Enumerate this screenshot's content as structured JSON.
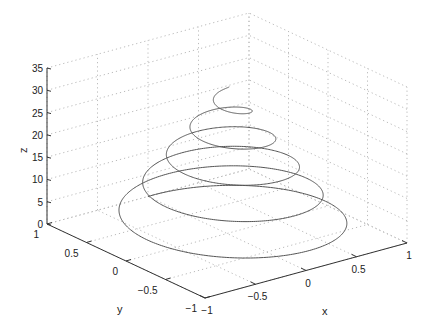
{
  "chart_data": {
    "type": "line3d",
    "title": "",
    "xlabel": "x",
    "ylabel": "y",
    "zlabel": "z",
    "xlim": [
      -1,
      1
    ],
    "ylim": [
      -1,
      1
    ],
    "zlim": [
      0,
      35
    ],
    "grid": true,
    "x_ticks": [
      -1,
      -0.5,
      0,
      0.5,
      1
    ],
    "y_ticks": [
      -1,
      -0.5,
      0,
      0.5,
      1
    ],
    "z_ticks": [
      0,
      5,
      10,
      15,
      20,
      25,
      30,
      35
    ],
    "x_tick_labels": [
      "−1",
      "−0.5",
      "0",
      "0.5",
      "1"
    ],
    "y_tick_labels": [
      "−1",
      "−0.5",
      "0",
      "0.5",
      "1"
    ],
    "z_tick_labels": [
      "0",
      "5",
      "10",
      "15",
      "20",
      "25",
      "30",
      "35"
    ],
    "series": [
      {
        "name": "conical helix",
        "description": "x = (1 - t/34)·sin(t), y = (1 - t/34)·cos(t), z = t, t from 0 to ~32.5",
        "t_start": 0,
        "t_end": 32.5,
        "radius_decay_z": 34,
        "color": "#555555"
      }
    ],
    "colors": {
      "axis": "#333333",
      "grid": "#bbbbbb",
      "line": "#555555"
    }
  }
}
